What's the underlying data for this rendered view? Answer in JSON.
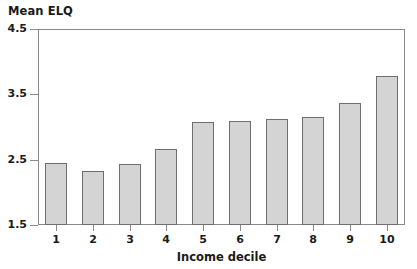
{
  "chart_data": {
    "type": "bar",
    "title": "Mean ELQ",
    "xlabel": "Income decile",
    "ylabel": "Mean ELQ",
    "categories": [
      "1",
      "2",
      "3",
      "4",
      "5",
      "6",
      "7",
      "8",
      "9",
      "10"
    ],
    "values": [
      2.45,
      2.33,
      2.44,
      2.66,
      3.08,
      3.09,
      3.12,
      3.15,
      3.36,
      3.78
    ],
    "ylim": [
      1.5,
      4.5
    ],
    "yticks": [
      "1.5",
      "2.5",
      "3.5",
      "4.5"
    ],
    "ytick_values": [
      1.5,
      2.5,
      3.5,
      4.5
    ],
    "grid": false,
    "legend": false,
    "bar_fill": "#d4d4d4",
    "bar_edge": "#6e6e6e",
    "axis_color": "#8a8a8a"
  }
}
